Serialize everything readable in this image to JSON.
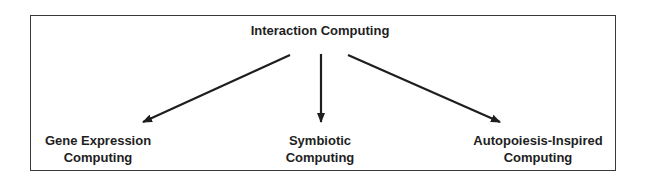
{
  "diagram": {
    "type": "tree",
    "root": {
      "label": "Interaction Computing"
    },
    "children": [
      {
        "line1": "Gene Expression",
        "line2": "Computing"
      },
      {
        "line1": "Symbiotic",
        "line2": "Computing"
      },
      {
        "line1": "Autopoiesis-Inspired",
        "line2": "Computing"
      }
    ],
    "edges": [
      {
        "from": "Interaction Computing",
        "to": "Gene Expression Computing"
      },
      {
        "from": "Interaction Computing",
        "to": "Symbiotic Computing"
      },
      {
        "from": "Interaction Computing",
        "to": "Autopoiesis-Inspired Computing"
      }
    ],
    "colors": {
      "stroke": "#1e1e1e",
      "frame": "#3a3a3a",
      "background": "#ffffff"
    }
  }
}
